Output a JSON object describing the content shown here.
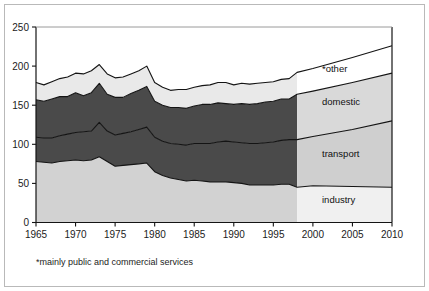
{
  "figure": {
    "footnote": "*mainly public and commercial services",
    "border_color": "#b9b9b9",
    "background": "#ffffff"
  },
  "axes": {
    "y_ticks": [
      "0",
      "50",
      "100",
      "150",
      "200",
      "250"
    ],
    "x_ticks": [
      "1965",
      "1970",
      "1975",
      "1980",
      "1985",
      "1990",
      "1995",
      "2000",
      "2005",
      "2010"
    ],
    "axis_color": "#1b1b1b"
  },
  "series_labels": [
    {
      "name": "other-label",
      "text": "*other"
    },
    {
      "name": "domestic-label",
      "text": "domestic"
    },
    {
      "name": "transport-label",
      "text": "transport"
    },
    {
      "name": "industry-label",
      "text": "industry"
    }
  ],
  "chart_data": {
    "type": "area",
    "stacked": true,
    "title": "",
    "xlabel": "",
    "ylabel": "",
    "xlim": [
      1965,
      2010
    ],
    "ylim": [
      0,
      250
    ],
    "grid": false,
    "legend_position": "inline-right",
    "projection_start": 1998,
    "colors": {
      "industry": "#d2d2d2",
      "transport": "#4a4a4a",
      "domestic": "#4a4a4a",
      "other": "#e9e9e9",
      "industry_projection": "#f0f0f0",
      "transport_projection": "#cfcfcf",
      "domestic_projection": "#d9d9d9",
      "other_projection": "#ffffff",
      "line": "#141414"
    },
    "note": "Historical shading is darker; values after 1998 are projections shown with lighter shading.",
    "x": [
      1965,
      1966,
      1967,
      1968,
      1969,
      1970,
      1971,
      1972,
      1973,
      1974,
      1975,
      1976,
      1977,
      1978,
      1979,
      1980,
      1981,
      1982,
      1983,
      1984,
      1985,
      1986,
      1987,
      1988,
      1989,
      1990,
      1991,
      1992,
      1993,
      1994,
      1995,
      1996,
      1997,
      1998,
      2000,
      2005,
      2010
    ],
    "series": [
      {
        "name": "industry",
        "label": "industry",
        "values": [
          78,
          77,
          76,
          78,
          79,
          80,
          79,
          80,
          84,
          78,
          72,
          73,
          74,
          75,
          76,
          65,
          60,
          57,
          55,
          53,
          54,
          53,
          52,
          52,
          52,
          51,
          50,
          48,
          48,
          48,
          48,
          49,
          49,
          45,
          47,
          46,
          45
        ]
      },
      {
        "name": "transport",
        "label": "transport",
        "values": [
          31,
          31,
          32,
          33,
          34,
          35,
          37,
          37,
          44,
          39,
          40,
          41,
          42,
          44,
          46,
          44,
          44,
          44,
          45,
          46,
          47,
          48,
          49,
          51,
          52,
          52,
          52,
          53,
          53,
          54,
          55,
          56,
          57,
          61,
          63,
          73,
          85
        ]
      },
      {
        "name": "domestic",
        "label": "domestic",
        "values": [
          48,
          47,
          50,
          50,
          48,
          51,
          46,
          49,
          50,
          47,
          48,
          46,
          49,
          50,
          52,
          46,
          46,
          46,
          47,
          47,
          48,
          50,
          50,
          50,
          48,
          48,
          50,
          50,
          51,
          52,
          52,
          53,
          52,
          58,
          58,
          60,
          61
        ]
      },
      {
        "name": "other",
        "label": "*other",
        "values": [
          22,
          21,
          22,
          23,
          25,
          25,
          28,
          28,
          24,
          26,
          25,
          26,
          25,
          25,
          26,
          24,
          23,
          22,
          23,
          24,
          24,
          24,
          25,
          26,
          27,
          25,
          26,
          26,
          26,
          25,
          25,
          25,
          26,
          28,
          29,
          32,
          35
        ]
      }
    ]
  }
}
